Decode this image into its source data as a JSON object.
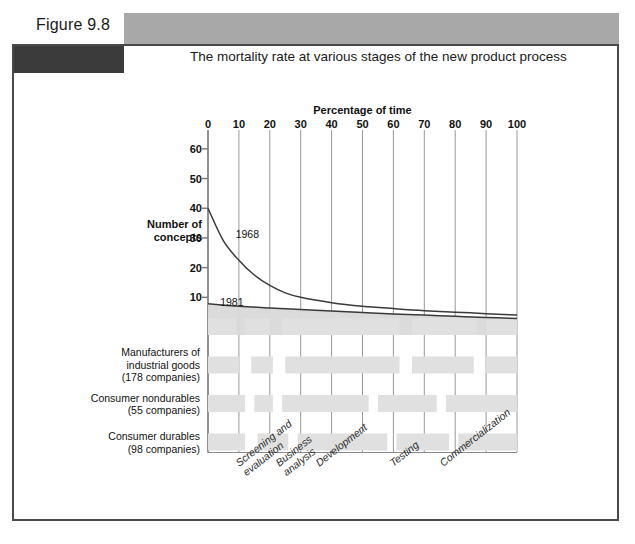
{
  "figure": {
    "number": "Figure 9.8",
    "caption": "The mortality rate at various stages of the new product process"
  },
  "chart_data": {
    "type": "line",
    "title": "The mortality rate at various stages of the new product process",
    "xlabel": "Percentage of time",
    "ylabel": "Number of concepts",
    "xlim": [
      0,
      100
    ],
    "ylim": [
      0,
      65
    ],
    "grid": true,
    "legend_position": "inline-annotation",
    "xticks": [
      "0",
      "10",
      "20",
      "30",
      "40",
      "50",
      "60",
      "70",
      "80",
      "90",
      "100"
    ],
    "yticks": [
      "60",
      "50",
      "40",
      "30",
      "20",
      "10"
    ],
    "annotations": [
      {
        "text": "1968",
        "x": 7,
        "y": 31
      },
      {
        "text": "1981",
        "x": 2,
        "y": 8
      }
    ],
    "series": [
      {
        "name": "1968",
        "x": [
          0,
          5,
          10,
          15,
          20,
          25,
          30,
          40,
          50,
          60,
          70,
          80,
          90,
          100
        ],
        "values": [
          40,
          29,
          22.5,
          17.5,
          14,
          11.5,
          10,
          8.2,
          7,
          6.2,
          5.5,
          5,
          4.5,
          4
        ]
      },
      {
        "name": "1981",
        "x": [
          0,
          10,
          20,
          30,
          40,
          50,
          60,
          70,
          80,
          90,
          100
        ],
        "values": [
          7.8,
          7.0,
          6.4,
          5.9,
          5.4,
          4.9,
          4.4,
          4.0,
          3.6,
          3.2,
          2.9
        ]
      }
    ],
    "stage_labels": [
      {
        "lines": [
          "Screening and",
          "evaluation"
        ],
        "x": 8
      },
      {
        "lines": [
          "Business",
          "analysis"
        ],
        "x": 21
      },
      {
        "lines": [
          "Development"
        ],
        "x": 34
      },
      {
        "lines": [
          "Testing"
        ],
        "x": 58
      },
      {
        "lines": [
          "Commercialization"
        ],
        "x": 74
      }
    ],
    "bar_rows": [
      {
        "label_lines": [],
        "label": "",
        "segments": [
          {
            "start": 0,
            "end": 9
          },
          {
            "start": 12,
            "end": 20
          },
          {
            "start": 24,
            "end": 62
          },
          {
            "start": 66,
            "end": 87
          },
          {
            "start": 90,
            "end": 100
          }
        ]
      },
      {
        "label_lines": [
          "Manufacturers of",
          "industrial goods",
          "(178 companies)"
        ],
        "label": "Manufacturers of industrial goods (178 companies)",
        "segments": [
          {
            "start": 0,
            "end": 10
          },
          {
            "start": 14,
            "end": 21
          },
          {
            "start": 25,
            "end": 62
          },
          {
            "start": 66,
            "end": 86
          },
          {
            "start": 90,
            "end": 100
          }
        ]
      },
      {
        "label_lines": [
          "Consumer nondurables",
          "(55 companies)"
        ],
        "label": "Consumer nondurables (55 companies)",
        "segments": [
          {
            "start": 0,
            "end": 12
          },
          {
            "start": 15,
            "end": 21
          },
          {
            "start": 24,
            "end": 52
          },
          {
            "start": 55,
            "end": 74
          },
          {
            "start": 77,
            "end": 100
          }
        ]
      },
      {
        "label_lines": [
          "Consumer durables",
          "(98 companies)"
        ],
        "label": "Consumer durables (98 companies)",
        "segments": [
          {
            "start": 0,
            "end": 12
          },
          {
            "start": 16,
            "end": 26
          },
          {
            "start": 29,
            "end": 58
          },
          {
            "start": 61,
            "end": 78
          },
          {
            "start": 81,
            "end": 100
          }
        ]
      }
    ],
    "colors": {
      "bar_fill": "#e0e0e0",
      "curve": "#3a3a3a",
      "area_fill": "#d9d9d9",
      "gridline": "#999999",
      "banner_gray": "#a8a8a8",
      "banner_dark": "#3b3b3b",
      "frame": "#4a4a4a"
    }
  }
}
